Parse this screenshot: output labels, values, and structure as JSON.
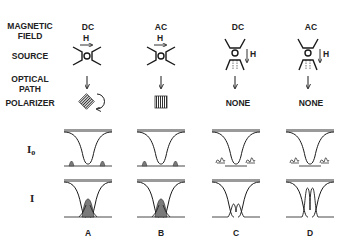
{
  "row_labels": {
    "magnetic_field": [
      "MAGNETIC",
      "FIELD"
    ],
    "source": "SOURCE",
    "optical_path": [
      "OPTICAL",
      "PATH"
    ],
    "polarizer": "POLARIZER",
    "i0": "I",
    "i0_sub": "o",
    "i": "I"
  },
  "columns": [
    {
      "field": "DC",
      "polarizer": "rotating",
      "panel": "A",
      "h_label": "H"
    },
    {
      "field": "AC",
      "polarizer": "fixed",
      "panel": "B",
      "h_label": "H"
    },
    {
      "field": "DC",
      "polarizer": "NONE",
      "panel": "C",
      "h_label": "H"
    },
    {
      "field": "AC",
      "polarizer": "NONE",
      "panel": "D",
      "h_label": "H"
    }
  ],
  "icons": [
    "right-arrow-icon",
    "down-arrow-icon",
    "polarizer-grid-icon",
    "rotation-arrow-icon",
    "source-electrode-icon"
  ],
  "colors": {
    "line": "#1a1a1a",
    "band": "#9a9a9a",
    "fill": "#7a7a7a"
  }
}
